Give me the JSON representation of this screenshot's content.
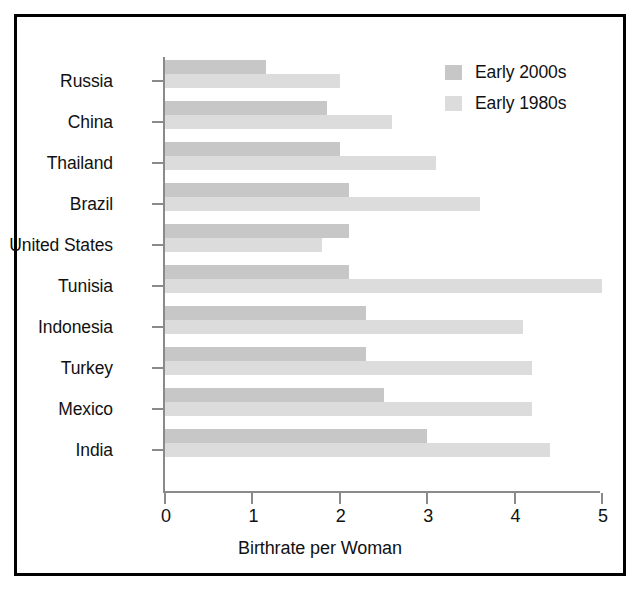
{
  "chart_data": {
    "type": "bar",
    "orientation": "horizontal",
    "title": "",
    "xlabel": "Birthrate per Woman",
    "ylabel": "",
    "xlim": [
      0,
      5
    ],
    "xticks": [
      "0",
      "1",
      "2",
      "3",
      "4",
      "5"
    ],
    "grid": false,
    "legend_position": "top-right",
    "categories": [
      "Russia",
      "China",
      "Thailand",
      "Brazil",
      "United States",
      "Tunisia",
      "Indonesia",
      "Turkey",
      "Mexico",
      "India"
    ],
    "series": [
      {
        "name": "Early 2000s",
        "color": "#c7c7c7",
        "values": [
          1.15,
          1.85,
          2.0,
          2.1,
          2.1,
          2.1,
          2.3,
          2.3,
          2.5,
          3.0
        ]
      },
      {
        "name": "Early 1980s",
        "color": "#dcdcdc",
        "values": [
          2.0,
          2.6,
          3.1,
          3.6,
          1.8,
          5.0,
          4.1,
          4.2,
          4.2,
          4.4
        ]
      }
    ]
  },
  "legend": {
    "entries": [
      {
        "label": "Early 2000s",
        "color": "#c7c7c7"
      },
      {
        "label": "Early 1980s",
        "color": "#dcdcdc"
      }
    ]
  },
  "axis": {
    "x_title": "Birthrate per Woman",
    "x_tick_labels": [
      "0",
      "1",
      "2",
      "3",
      "4",
      "5"
    ]
  },
  "style": {
    "border_color": "#000000",
    "axis_color": "#8a8a8a",
    "text_color": "#111111",
    "background": "#ffffff"
  }
}
